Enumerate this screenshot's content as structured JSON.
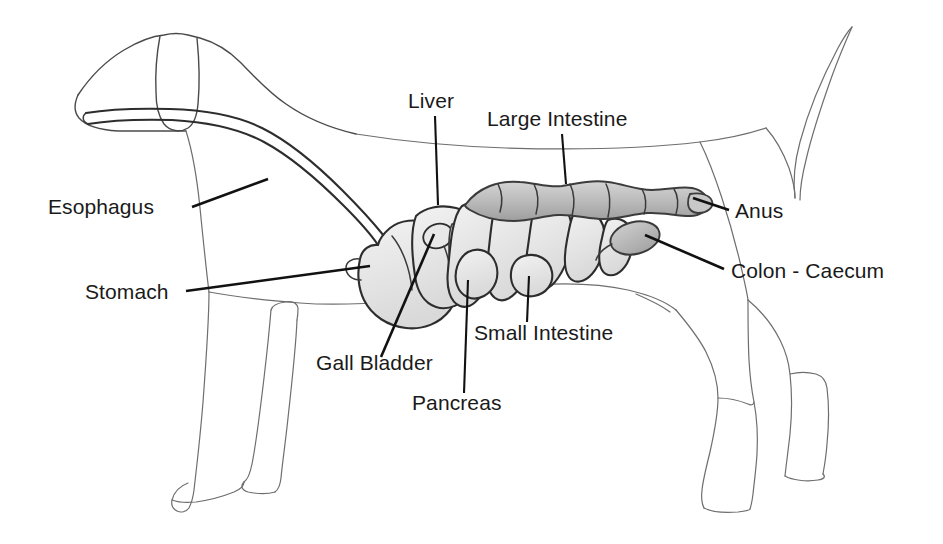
{
  "diagram": {
    "view": "lateral-left",
    "background_color": "#ffffff",
    "outline_color": "#4a4a4a",
    "label_color": "#1a1a1a",
    "leader_color": "#111111",
    "organ_shade_color": "#b9b9b9",
    "organ_shade_light": "#e2e2e2"
  },
  "labels": [
    {
      "id": "esophagus",
      "text": "Esophagus",
      "x": 48,
      "y": 214,
      "anchor": "start",
      "leader": {
        "x1": 192,
        "y1": 207,
        "x2": 268,
        "y2": 179
      }
    },
    {
      "id": "liver",
      "text": "Liver",
      "x": 408,
      "y": 108,
      "anchor": "start",
      "leader": {
        "x1": 435,
        "y1": 116,
        "x2": 438,
        "y2": 205
      }
    },
    {
      "id": "large-intestine",
      "text": "Large Intestine",
      "x": 487,
      "y": 126,
      "anchor": "start",
      "leader": {
        "x1": 562,
        "y1": 134,
        "x2": 566,
        "y2": 184
      }
    },
    {
      "id": "anus",
      "text": "Anus",
      "x": 735,
      "y": 218,
      "anchor": "start",
      "leader": {
        "x1": 729,
        "y1": 210,
        "x2": 693,
        "y2": 198
      }
    },
    {
      "id": "colon-caecum",
      "text": "Colon - Caecum",
      "x": 731,
      "y": 278,
      "anchor": "start",
      "leader": {
        "x1": 724,
        "y1": 269,
        "x2": 645,
        "y2": 235
      }
    },
    {
      "id": "stomach",
      "text": "Stomach",
      "x": 85,
      "y": 299,
      "anchor": "start",
      "leader": {
        "x1": 186,
        "y1": 291,
        "x2": 370,
        "y2": 266
      }
    },
    {
      "id": "gall-bladder",
      "text": "Gall Bladder",
      "x": 316,
      "y": 370,
      "anchor": "start",
      "leader": {
        "x1": 381,
        "y1": 357,
        "x2": 434,
        "y2": 234
      }
    },
    {
      "id": "pancreas",
      "text": "Pancreas",
      "x": 412,
      "y": 410,
      "anchor": "start",
      "leader": {
        "x1": 464,
        "y1": 393,
        "x2": 468,
        "y2": 280
      }
    },
    {
      "id": "small-intestine",
      "text": "Small Intestine",
      "x": 474,
      "y": 340,
      "anchor": "start",
      "leader": {
        "x1": 527,
        "y1": 322,
        "x2": 529,
        "y2": 276
      }
    }
  ],
  "organs": [
    {
      "id": "esophagus",
      "name": "Esophagus",
      "shade": "none"
    },
    {
      "id": "stomach",
      "name": "Stomach",
      "shade": "light"
    },
    {
      "id": "liver",
      "name": "Liver",
      "shade": "light"
    },
    {
      "id": "gall-bladder",
      "name": "Gall Bladder",
      "shade": "light"
    },
    {
      "id": "pancreas",
      "name": "Pancreas",
      "shade": "light"
    },
    {
      "id": "small-intestine",
      "name": "Small Intestine",
      "shade": "light"
    },
    {
      "id": "large-intestine",
      "name": "Large Intestine",
      "shade": "medium"
    },
    {
      "id": "caecum",
      "name": "Colon - Caecum",
      "shade": "medium"
    },
    {
      "id": "anus",
      "name": "Anus",
      "shade": "none"
    }
  ]
}
